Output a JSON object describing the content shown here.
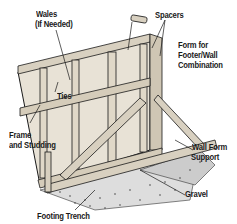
{
  "diagram": {
    "colors": {
      "ink": "#1a1a1a",
      "wood": "#e8e2d6",
      "background": "#ffffff"
    },
    "labels": {
      "wales": "Wales",
      "wales_note": "(If Needed)",
      "spacers": "Spacers",
      "form_line1": "Form for",
      "form_line2": "Footer/Wall",
      "form_line3": "Combination",
      "ties": "Ties",
      "frame_line1": "Frame",
      "frame_line2": "and Studding",
      "support_line1": "Wall Form",
      "support_line2": "Support",
      "gravel": "Gravel",
      "trench": "Footing Trench"
    }
  }
}
